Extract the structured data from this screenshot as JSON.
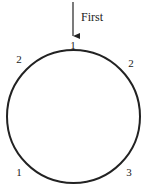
{
  "diagram": {
    "type": "circular-sequence",
    "arrow_label": "First",
    "colors": {
      "stroke": "#222222",
      "background": "#ffffff"
    },
    "circle": {
      "cx": 73.5,
      "cy": 116.5,
      "r": 66.5
    },
    "labels": [
      {
        "id": "top",
        "text": "1"
      },
      {
        "id": "upper-left",
        "text": "2"
      },
      {
        "id": "upper-right",
        "text": "2"
      },
      {
        "id": "lower-left",
        "text": "1"
      },
      {
        "id": "lower-right",
        "text": "3"
      }
    ]
  }
}
